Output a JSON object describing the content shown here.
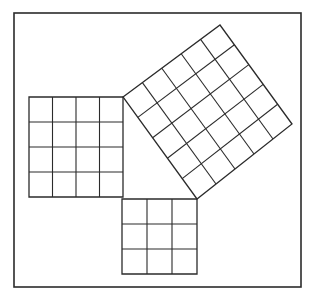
{
  "figure": {
    "background_color": "#ffffff",
    "stroke_color": "#2b2b2b",
    "frame": {
      "label": "outer-border",
      "x": 14,
      "y": 13,
      "width": 287,
      "height": 274,
      "stroke_width": 1.6
    },
    "triangle": {
      "label": "right-triangle-3-4-5",
      "vertices": [
        {
          "name": "right-angle-vertex",
          "x": 123,
          "y": 197
        },
        {
          "name": "upper-vertex",
          "x": 123,
          "y": 97
        },
        {
          "name": "lower-right-vertex",
          "x": 197,
          "y": 199
        }
      ],
      "legs": [
        4,
        3
      ],
      "hypotenuse": 5
    },
    "squares": [
      {
        "id": "leg-a-square",
        "name": "left-square",
        "side_label": "a",
        "side_units": 4,
        "cells": 16,
        "grid_rows": 4,
        "grid_cols": 4,
        "rotation_deg": 0,
        "corners": [
          {
            "x": 29,
            "y": 97
          },
          {
            "x": 123,
            "y": 97
          },
          {
            "x": 123,
            "y": 197
          },
          {
            "x": 29,
            "y": 197
          }
        ],
        "stroke_width": 1.3
      },
      {
        "id": "leg-b-square",
        "name": "bottom-square",
        "side_label": "b",
        "side_units": 3,
        "cells": 9,
        "grid_rows": 3,
        "grid_cols": 3,
        "rotation_deg": 0,
        "corners": [
          {
            "x": 122,
            "y": 199
          },
          {
            "x": 197,
            "y": 199
          },
          {
            "x": 197,
            "y": 274
          },
          {
            "x": 122,
            "y": 274
          }
        ],
        "stroke_width": 1.3
      },
      {
        "id": "hypotenuse-square",
        "name": "rotated-square",
        "side_label": "c",
        "side_units": 5,
        "cells": 25,
        "grid_rows": 5,
        "grid_cols": 5,
        "rotation_deg": -36,
        "corners": [
          {
            "x": 123,
            "y": 97
          },
          {
            "x": 220,
            "y": 25
          },
          {
            "x": 292,
            "y": 124
          },
          {
            "x": 197,
            "y": 199
          }
        ],
        "stroke_width": 1.3
      }
    ]
  },
  "chart_data": {
    "type": "diagram",
    "relation": "a^2 + b^2 = c^2",
    "categories": [
      "leg a",
      "leg b",
      "hypotenuse c"
    ],
    "values": [
      16,
      9,
      25
    ],
    "series": [
      {
        "name": "side length (units)",
        "values": [
          4,
          3,
          5
        ]
      },
      {
        "name": "square area (unit cells)",
        "values": [
          16,
          9,
          25
        ]
      }
    ],
    "xlabel": "",
    "ylabel": "",
    "grid": true,
    "legend": "none"
  }
}
